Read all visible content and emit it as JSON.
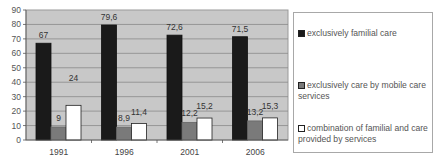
{
  "chart_data": {
    "type": "bar",
    "title": "",
    "xlabel": "",
    "ylabel": "",
    "ylim": [
      0,
      90
    ],
    "yticks": [
      0,
      10,
      20,
      30,
      40,
      50,
      60,
      70,
      80,
      90
    ],
    "grid": true,
    "legend_position": "right",
    "categories": [
      "1991",
      "1996",
      "2001",
      "2006"
    ],
    "series": [
      {
        "name": "exclusively familial care",
        "color": "#1a1a1a",
        "values": [
          67,
          79.6,
          72.6,
          71.5
        ],
        "labels": [
          "67",
          "79,6",
          "72,6",
          "71,5"
        ]
      },
      {
        "name": "exclusively care by mobile care services",
        "color": "#7a7a7a",
        "values": [
          9,
          8.9,
          12.2,
          13.2
        ],
        "labels": [
          "9",
          "8,9",
          "12,2",
          "13,2"
        ]
      },
      {
        "name": "combination of familial and care provided by services",
        "color": "#ffffff",
        "values": [
          24,
          11.4,
          15.2,
          15.3
        ],
        "labels": [
          "24",
          "11,4",
          "15,2",
          "15,3"
        ]
      }
    ]
  },
  "legend": {
    "items": [
      {
        "label": "exclusively familial care",
        "color": "#1a1a1a"
      },
      {
        "label": "exclusively care by mobile care services",
        "color": "#7a7a7a"
      },
      {
        "label": "combination of familial and care provided by services",
        "color": "#ffffff"
      }
    ]
  }
}
